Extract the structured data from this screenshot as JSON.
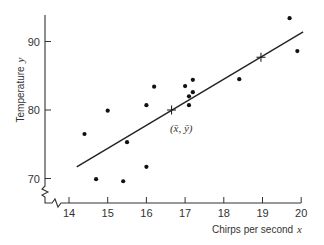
{
  "chart_data": {
    "type": "scatter",
    "title": "",
    "xlabel": "Chirps per second",
    "xlabel_var": "x",
    "ylabel": "Temperature",
    "ylabel_var": "y",
    "xlim": [
      14,
      20
    ],
    "ylim": [
      70,
      90
    ],
    "x_ticks": [
      14,
      15,
      16,
      17,
      18,
      19,
      20
    ],
    "y_ticks": [
      70,
      80,
      90
    ],
    "axis_breaks": true,
    "grid": false,
    "legend": "none",
    "points": [
      {
        "x": 14.4,
        "y": 76.5
      },
      {
        "x": 14.7,
        "y": 69.9
      },
      {
        "x": 15.0,
        "y": 79.9
      },
      {
        "x": 15.4,
        "y": 69.6
      },
      {
        "x": 15.5,
        "y": 75.3
      },
      {
        "x": 16.0,
        "y": 80.7
      },
      {
        "x": 16.0,
        "y": 71.7
      },
      {
        "x": 16.2,
        "y": 83.4
      },
      {
        "x": 17.0,
        "y": 83.5
      },
      {
        "x": 17.1,
        "y": 80.7
      },
      {
        "x": 17.1,
        "y": 82.0
      },
      {
        "x": 17.2,
        "y": 82.6
      },
      {
        "x": 17.2,
        "y": 84.4
      },
      {
        "x": 18.4,
        "y": 84.5
      },
      {
        "x": 19.7,
        "y": 93.4
      },
      {
        "x": 19.9,
        "y": 88.6
      }
    ],
    "regression_line": {
      "x_start": 14.2,
      "y_start": 71.7,
      "x_end": 20.05,
      "y_end": 91.4
    },
    "marked_points": [
      {
        "x": 16.65,
        "y": 80.0,
        "label": "mean"
      },
      {
        "x": 18.96,
        "y": 87.7,
        "label": ""
      }
    ],
    "annotations": [
      {
        "text": "(x̄, ȳ)",
        "x": 16.9,
        "y": 76.8
      }
    ]
  }
}
